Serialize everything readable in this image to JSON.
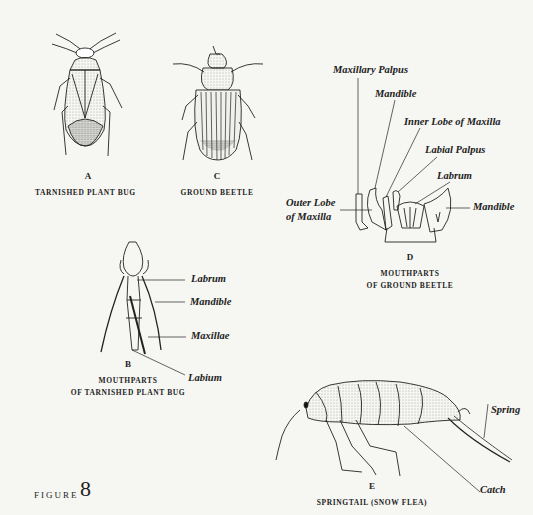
{
  "figure": {
    "word": "FIGURE",
    "number": "8"
  },
  "panels": {
    "A": {
      "letter": "A",
      "caption": "TARNISHED PLANT BUG"
    },
    "C": {
      "letter": "C",
      "caption": "GROUND BEETLE"
    },
    "D": {
      "letter": "D",
      "caption_line1": "MOUTHPARTS",
      "caption_line2": "OF GROUND BEETLE",
      "labels": {
        "maxillary_palpus": "Maxillary Palpus",
        "mandible_top": "Mandible",
        "inner_lobe": "Inner Lobe of Maxilla",
        "labial_palpus": "Labial Palpus",
        "labrum": "Labrum",
        "outer_lobe_line1": "Outer Lobe",
        "outer_lobe_line2": "of Maxilla",
        "mandible_right": "Mandible"
      }
    },
    "B": {
      "letter": "B",
      "caption_line1": "MOUTHPARTS",
      "caption_line2": "OF TARNISHED PLANT BUG",
      "labels": {
        "labrum": "Labrum",
        "mandible": "Mandible",
        "maxillae": "Maxillae",
        "labium": "Labium"
      }
    },
    "E": {
      "letter": "E",
      "caption": "SPRINGTAIL (SNOW FLEA)",
      "labels": {
        "spring": "Spring",
        "catch": "Catch"
      }
    }
  },
  "colors": {
    "background": "#f6f6f3",
    "ink": "#1e1e1e"
  }
}
